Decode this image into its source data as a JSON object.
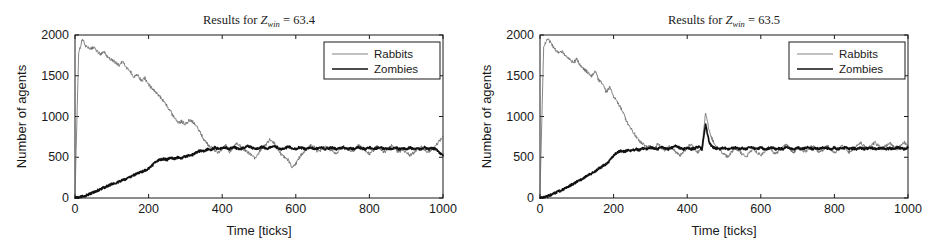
{
  "figure": {
    "name": "zombie-rabbit-simulation-results",
    "panel_count": 2
  },
  "chart_data": [
    {
      "type": "line",
      "panel_index": 0,
      "title": "Results for Z_win = 63.4",
      "title_parts": {
        "prefix": "Results for ",
        "symbol": "Z",
        "subscript": "win",
        "equals": " = ",
        "value": "63.4"
      },
      "xlabel": "Time [ticks]",
      "ylabel": "Number of agents",
      "xlim": [
        0,
        1000
      ],
      "ylim": [
        0,
        2000
      ],
      "xticks": [
        0,
        200,
        400,
        600,
        800,
        1000
      ],
      "yticks": [
        0,
        500,
        1000,
        1500,
        2000
      ],
      "grid": false,
      "legend_position": "upper right",
      "series": [
        {
          "name": "Rabbits",
          "color": "#6e6e6e",
          "width": "thin",
          "x": [
            0,
            10,
            20,
            30,
            40,
            50,
            60,
            70,
            80,
            90,
            100,
            110,
            120,
            130,
            140,
            150,
            160,
            170,
            180,
            190,
            200,
            210,
            220,
            230,
            240,
            250,
            260,
            270,
            280,
            290,
            300,
            310,
            320,
            330,
            340,
            350,
            360,
            370,
            380,
            390,
            400,
            410,
            420,
            430,
            440,
            450,
            460,
            470,
            480,
            490,
            500,
            510,
            520,
            530,
            540,
            550,
            560,
            570,
            580,
            590,
            600,
            610,
            620,
            630,
            640,
            650,
            660,
            670,
            680,
            690,
            700,
            710,
            720,
            730,
            740,
            750,
            760,
            770,
            780,
            790,
            800,
            810,
            820,
            830,
            840,
            850,
            860,
            870,
            880,
            890,
            900,
            910,
            920,
            930,
            940,
            950,
            960,
            970,
            980,
            990,
            1000
          ],
          "y": [
            60,
            1780,
            1950,
            1860,
            1830,
            1850,
            1800,
            1760,
            1790,
            1720,
            1700,
            1660,
            1630,
            1680,
            1600,
            1560,
            1480,
            1520,
            1440,
            1470,
            1390,
            1340,
            1300,
            1250,
            1190,
            1130,
            1060,
            980,
            920,
            940,
            900,
            960,
            930,
            880,
            800,
            720,
            660,
            620,
            580,
            560,
            600,
            640,
            560,
            620,
            680,
            630,
            590,
            560,
            520,
            480,
            560,
            620,
            660,
            720,
            680,
            600,
            540,
            500,
            460,
            380,
            420,
            500,
            560,
            600,
            650,
            620,
            560,
            600,
            640,
            600,
            580,
            540,
            600,
            640,
            600,
            560,
            600,
            640,
            620,
            580,
            540,
            580,
            640,
            600,
            560,
            600,
            640,
            600,
            560,
            600,
            560,
            520,
            560,
            600,
            640,
            600,
            560,
            600,
            640,
            700,
            760
          ]
        },
        {
          "name": "Zombies",
          "color": "#111111",
          "width": "thick",
          "x": [
            0,
            10,
            20,
            30,
            40,
            50,
            60,
            70,
            80,
            90,
            100,
            110,
            120,
            130,
            140,
            150,
            160,
            170,
            180,
            190,
            200,
            210,
            220,
            230,
            240,
            250,
            260,
            270,
            280,
            290,
            300,
            310,
            320,
            330,
            340,
            350,
            360,
            370,
            380,
            390,
            400,
            410,
            420,
            430,
            440,
            450,
            460,
            470,
            480,
            490,
            500,
            510,
            520,
            530,
            540,
            550,
            560,
            570,
            580,
            590,
            600,
            610,
            620,
            630,
            640,
            650,
            660,
            670,
            680,
            690,
            700,
            710,
            720,
            730,
            740,
            750,
            760,
            770,
            780,
            790,
            800,
            810,
            820,
            830,
            840,
            850,
            860,
            870,
            880,
            890,
            900,
            910,
            920,
            930,
            940,
            950,
            960,
            970,
            980,
            990,
            1000
          ],
          "y": [
            0,
            10,
            20,
            30,
            50,
            70,
            90,
            110,
            130,
            150,
            170,
            180,
            200,
            220,
            230,
            260,
            280,
            300,
            320,
            340,
            360,
            400,
            450,
            470,
            480,
            470,
            490,
            480,
            500,
            490,
            510,
            520,
            530,
            560,
            580,
            570,
            600,
            590,
            620,
            600,
            610,
            620,
            600,
            630,
            610,
            600,
            620,
            640,
            620,
            600,
            610,
            630,
            600,
            620,
            640,
            620,
            600,
            610,
            630,
            610,
            600,
            620,
            610,
            600,
            620,
            600,
            610,
            630,
            600,
            610,
            620,
            600,
            610,
            620,
            600,
            610,
            600,
            620,
            610,
            600,
            620,
            600,
            610,
            620,
            600,
            610,
            600,
            620,
            600,
            610,
            600,
            620,
            600,
            610,
            600,
            620,
            600,
            610,
            600,
            560,
            520
          ]
        }
      ]
    },
    {
      "type": "line",
      "panel_index": 1,
      "title": "Results for Z_win = 63.5",
      "title_parts": {
        "prefix": "Results for ",
        "symbol": "Z",
        "subscript": "win",
        "equals": " = ",
        "value": "63.5"
      },
      "xlabel": "Time [ticks]",
      "ylabel": "Number of agents",
      "xlim": [
        0,
        1000
      ],
      "ylim": [
        0,
        2000
      ],
      "xticks": [
        0,
        200,
        400,
        600,
        800,
        1000
      ],
      "yticks": [
        0,
        500,
        1000,
        1500,
        2000
      ],
      "grid": false,
      "legend_position": "upper right",
      "series": [
        {
          "name": "Rabbits",
          "color": "#6e6e6e",
          "width": "thin",
          "x": [
            0,
            10,
            20,
            30,
            40,
            50,
            60,
            70,
            80,
            90,
            100,
            110,
            120,
            130,
            140,
            150,
            160,
            170,
            180,
            190,
            200,
            210,
            220,
            230,
            240,
            250,
            260,
            270,
            280,
            290,
            300,
            310,
            320,
            330,
            340,
            350,
            360,
            370,
            380,
            390,
            400,
            410,
            420,
            430,
            440,
            450,
            460,
            470,
            480,
            490,
            500,
            510,
            520,
            530,
            540,
            550,
            560,
            570,
            580,
            590,
            600,
            610,
            620,
            630,
            640,
            650,
            660,
            670,
            680,
            690,
            700,
            710,
            720,
            730,
            740,
            750,
            760,
            770,
            780,
            790,
            800,
            810,
            820,
            830,
            840,
            850,
            860,
            870,
            880,
            890,
            900,
            910,
            920,
            930,
            940,
            950,
            960,
            970,
            980,
            990,
            1000
          ],
          "y": [
            60,
            1860,
            1960,
            1900,
            1830,
            1790,
            1800,
            1740,
            1700,
            1660,
            1700,
            1620,
            1580,
            1540,
            1500,
            1560,
            1440,
            1400,
            1300,
            1360,
            1240,
            1180,
            1100,
            1000,
            900,
            840,
            760,
            700,
            660,
            620,
            640,
            600,
            660,
            620,
            580,
            640,
            600,
            560,
            520,
            560,
            620,
            660,
            600,
            560,
            620,
            1060,
            820,
            700,
            620,
            580,
            540,
            500,
            560,
            620,
            580,
            540,
            500,
            560,
            600,
            560,
            520,
            560,
            620,
            580,
            540,
            580,
            620,
            660,
            600,
            560,
            620,
            600,
            560,
            600,
            640,
            600,
            560,
            600,
            640,
            600,
            560,
            600,
            640,
            600,
            560,
            600,
            640,
            680,
            640,
            600,
            640,
            680,
            640,
            600,
            640,
            680,
            640,
            600,
            640,
            680,
            640
          ]
        },
        {
          "name": "Zombies",
          "color": "#111111",
          "width": "thick",
          "x": [
            0,
            10,
            20,
            30,
            40,
            50,
            60,
            70,
            80,
            90,
            100,
            110,
            120,
            130,
            140,
            150,
            160,
            170,
            180,
            190,
            200,
            210,
            220,
            230,
            240,
            250,
            260,
            270,
            280,
            290,
            300,
            310,
            320,
            330,
            340,
            350,
            360,
            370,
            380,
            390,
            400,
            410,
            420,
            430,
            440,
            450,
            460,
            470,
            480,
            490,
            500,
            510,
            520,
            530,
            540,
            550,
            560,
            570,
            580,
            590,
            600,
            610,
            620,
            630,
            640,
            650,
            660,
            670,
            680,
            690,
            700,
            710,
            720,
            730,
            740,
            750,
            760,
            770,
            780,
            790,
            800,
            810,
            820,
            830,
            840,
            850,
            860,
            870,
            880,
            890,
            900,
            910,
            920,
            930,
            940,
            950,
            960,
            970,
            980,
            990,
            1000
          ],
          "y": [
            0,
            10,
            20,
            40,
            60,
            80,
            100,
            120,
            150,
            170,
            200,
            220,
            250,
            280,
            300,
            330,
            360,
            390,
            420,
            460,
            520,
            560,
            580,
            570,
            590,
            580,
            600,
            590,
            610,
            600,
            620,
            610,
            600,
            620,
            610,
            600,
            620,
            640,
            610,
            600,
            620,
            600,
            610,
            630,
            600,
            900,
            680,
            620,
            610,
            600,
            620,
            600,
            610,
            620,
            600,
            610,
            600,
            620,
            610,
            600,
            620,
            600,
            610,
            620,
            600,
            610,
            600,
            620,
            610,
            600,
            620,
            600,
            610,
            620,
            600,
            610,
            600,
            620,
            610,
            600,
            620,
            600,
            610,
            620,
            600,
            610,
            600,
            620,
            600,
            610,
            620,
            600,
            610,
            620,
            600,
            610,
            600,
            620,
            610,
            600,
            620
          ]
        }
      ]
    }
  ]
}
